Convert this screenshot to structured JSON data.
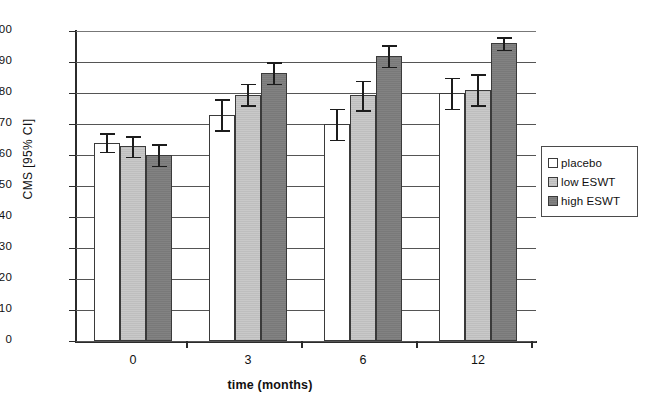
{
  "chart_data": {
    "type": "bar",
    "title": "",
    "xlabel": "time (months)",
    "ylabel": "CMS [95% CI]",
    "categories": [
      "0",
      "3",
      "6",
      "12"
    ],
    "ylim": [
      0,
      100
    ],
    "yticks": [
      0,
      10,
      20,
      30,
      40,
      50,
      60,
      70,
      80,
      90,
      100
    ],
    "grid": true,
    "legend_position": "right",
    "series": [
      {
        "name": "placebo",
        "color": "#ffffff",
        "values": [
          64,
          73,
          70,
          80
        ],
        "err_low": [
          61,
          68,
          65,
          75
        ],
        "err_high": [
          67,
          78,
          75,
          85
        ]
      },
      {
        "name": "low ESWT",
        "color": "#c9c9c9",
        "values": [
          63,
          79.5,
          79.5,
          81
        ],
        "err_low": [
          59.5,
          76,
          74.5,
          76
        ],
        "err_high": [
          66,
          83,
          84,
          86
        ]
      },
      {
        "name": "high ESWT",
        "color": "#828282",
        "values": [
          60,
          86.5,
          92,
          96
        ],
        "err_low": [
          56.5,
          83,
          88.5,
          94
        ]
      }
    ]
  },
  "legend": {
    "entries": [
      {
        "label": "placebo"
      },
      {
        "label": "low ESWT"
      },
      {
        "label": "high ESWT"
      }
    ]
  },
  "colors": {
    "placebo": "#ffffff",
    "low_eswt": "#c9c9c9",
    "high_eswt": "#828282",
    "axis": "#2b2b2b",
    "grid": "#555555"
  }
}
